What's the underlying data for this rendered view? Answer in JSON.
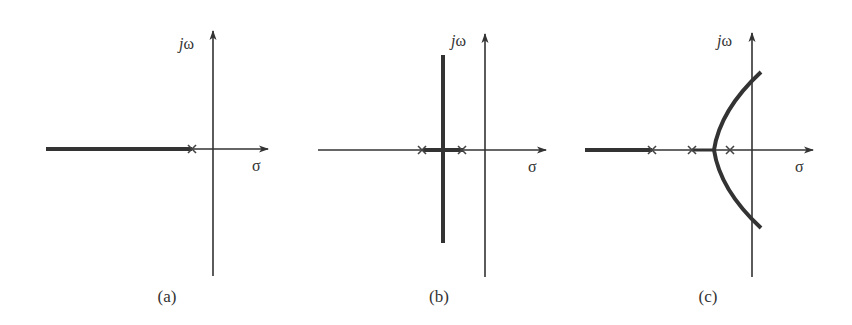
{
  "figure": {
    "colors": {
      "ink": "#333333",
      "background": "#ffffff"
    },
    "panels": [
      {
        "id": "a",
        "caption": "(a)",
        "imag_axis_label_j": "j",
        "imag_axis_label_w": "ω",
        "real_axis_label": "σ",
        "poles": 1,
        "locus_description": "Single real pole; locus along negative real axis to the left of the pole"
      },
      {
        "id": "b",
        "caption": "(b)",
        "imag_axis_label_j": "j",
        "imag_axis_label_w": "ω",
        "real_axis_label": "σ",
        "poles": 2,
        "locus_description": "Two real poles; locus on real axis between poles, breaks away vertically at midpoint"
      },
      {
        "id": "c",
        "caption": "(c)",
        "imag_axis_label_j": "j",
        "imag_axis_label_w": "ω",
        "real_axis_label": "σ",
        "poles": 3,
        "locus_description": "Three real poles; locus on real axis left of leftmost pole, breakaway between right two poles curving into right half-plane"
      }
    ]
  }
}
